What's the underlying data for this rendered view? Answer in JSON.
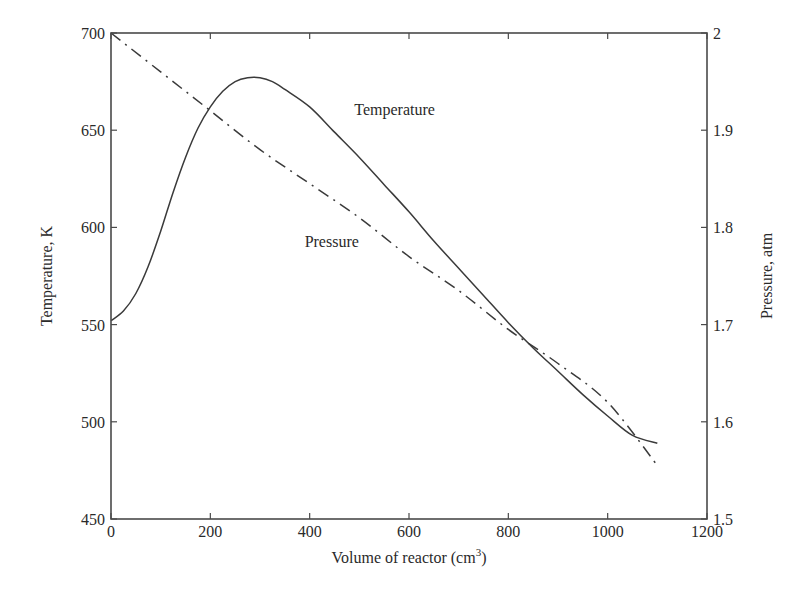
{
  "chart_data": {
    "type": "line",
    "title": "",
    "xlabel": "Volume of reactor (cm3)",
    "xlabel_main": "Volume of reactor (cm",
    "xlabel_sup": "3",
    "xlabel_close": ")",
    "ylabel_left": "Temperature, K",
    "ylabel_right": "Pressure, atm",
    "xlim": [
      0,
      1200
    ],
    "ylim_left": [
      450,
      700
    ],
    "ylim_right": [
      1.5,
      2.0
    ],
    "x_ticks": [
      "0",
      "200",
      "400",
      "600",
      "800",
      "1000",
      "1200"
    ],
    "y_ticks_left": [
      "450",
      "500",
      "550",
      "600",
      "650",
      "700"
    ],
    "y_ticks_right": [
      "1.5",
      "1.6",
      "1.7",
      "1.8",
      "1.9",
      "2"
    ],
    "grid": false,
    "legend": "none (inline annotations)",
    "annotations": [
      {
        "text": "Temperature",
        "x": 520,
        "y": 658
      },
      {
        "text": "Pressure",
        "x": 410,
        "y": 590
      }
    ],
    "series": [
      {
        "name": "Temperature",
        "axis": "left",
        "style": "solid",
        "x": [
          0,
          25,
          50,
          75,
          100,
          125,
          150,
          175,
          200,
          225,
          250,
          275,
          300,
          325,
          350,
          400,
          450,
          500,
          550,
          600,
          650,
          700,
          750,
          800,
          850,
          900,
          950,
          1000,
          1050,
          1100
        ],
        "values": [
          552,
          557,
          566,
          580,
          598,
          618,
          636,
          651,
          662,
          670,
          675,
          677,
          677,
          675,
          671,
          662,
          649,
          636,
          622,
          608,
          593,
          579,
          565,
          551,
          538,
          526,
          514,
          503,
          493,
          489
        ]
      },
      {
        "name": "Pressure",
        "axis": "right",
        "style": "dash-dot",
        "x": [
          0,
          100,
          200,
          300,
          400,
          500,
          600,
          700,
          800,
          900,
          1000,
          1100
        ],
        "values": [
          2.0,
          1.96,
          1.92,
          1.88,
          1.845,
          1.81,
          1.77,
          1.735,
          1.695,
          1.66,
          1.62,
          1.555
        ]
      }
    ]
  },
  "colors": {
    "line": "#3a3a3a",
    "axis": "#4a4a4a",
    "text": "#2a2a2a",
    "background": "#ffffff"
  }
}
